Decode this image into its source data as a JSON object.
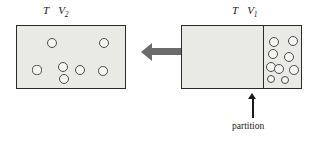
{
  "figure": {
    "type": "thermodynamics-free-expansion-diagram",
    "width": 315,
    "height": 142,
    "background": "#ffffff"
  },
  "colors": {
    "box_fill": "#e9e9e6",
    "box_stroke": "#2b2b2b",
    "molecule_stroke": "#4a4a4a",
    "molecule_fill": "#f4f4f2",
    "arrow_gray": "#6b6b6b",
    "pointer_black": "#1a1a1a",
    "text": "#1a1a1a"
  },
  "left_panel": {
    "label_temperature": "T",
    "label_volume": "V",
    "label_volume_subscript": "2",
    "box": {
      "x": 16,
      "y": 25,
      "width": 110,
      "height": 64
    },
    "molecule_count": 7,
    "molecules": [
      {
        "cx": 52,
        "cy": 43,
        "r": 5.0
      },
      {
        "cx": 104,
        "cy": 43,
        "r": 5.0
      },
      {
        "cx": 37,
        "cy": 70,
        "r": 4.6
      },
      {
        "cx": 63,
        "cy": 67,
        "r": 5.2
      },
      {
        "cx": 80,
        "cy": 70,
        "r": 5.0
      },
      {
        "cx": 103,
        "cy": 71,
        "r": 4.8
      },
      {
        "cx": 64,
        "cy": 79,
        "r": 5.0
      }
    ]
  },
  "transition_arrow": {
    "direction": "left",
    "shaft": {
      "x": 152,
      "y": 48,
      "width": 33,
      "height": 7
    },
    "head": {
      "x": 141,
      "y": 42
    }
  },
  "right_panel": {
    "label_temperature": "T",
    "label_volume": "V",
    "label_volume_subscript": "1",
    "box": {
      "x": 181,
      "y": 25,
      "width": 121,
      "height": 64
    },
    "partition": {
      "x": 263,
      "y": 25,
      "height": 64
    },
    "molecule_count": 9,
    "molecules": [
      {
        "cx": 274,
        "cy": 42,
        "r": 5.0
      },
      {
        "cx": 293,
        "cy": 41,
        "r": 5.0
      },
      {
        "cx": 273,
        "cy": 54,
        "r": 5.0
      },
      {
        "cx": 289,
        "cy": 57,
        "r": 5.0
      },
      {
        "cx": 271,
        "cy": 67,
        "r": 5.2
      },
      {
        "cx": 279,
        "cy": 69,
        "r": 5.2
      },
      {
        "cx": 294,
        "cy": 70,
        "r": 4.8
      },
      {
        "cx": 271,
        "cy": 79,
        "r": 4.4
      },
      {
        "cx": 285,
        "cy": 80,
        "r": 4.4
      }
    ]
  },
  "partition_annotation": {
    "caption": "partition",
    "pointer": {
      "x": 252,
      "y_top": 96,
      "y_bottom": 118
    },
    "caption_position": {
      "x": 232,
      "y": 122
    }
  }
}
